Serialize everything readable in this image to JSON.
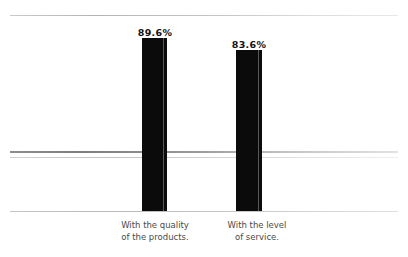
{
  "chart_data": {
    "type": "bar",
    "title": "",
    "subtitle": "",
    "xlabel": "",
    "ylabel": "",
    "grid": false,
    "legend": null,
    "ylim": [
      0,
      100
    ],
    "unit": "%",
    "categories": [
      "With the quality of the products.",
      "With the level of service."
    ],
    "category_lines": [
      [
        "With the quality",
        "of the products."
      ],
      [
        "With the level",
        "of service."
      ]
    ],
    "values": [
      89.6,
      83.6
    ],
    "value_labels": [
      "89.6%",
      "83.6%"
    ],
    "colors": {
      "bar": "#0b0b0b",
      "bar_highlight": "#575757",
      "rule": "#b4b4b4",
      "background": "#ffffff",
      "label_text": "#111111",
      "category_text": "#4a4a4a"
    },
    "rules": [
      {
        "name": "top-rule",
        "y": 15
      },
      {
        "name": "mid-rule-upper",
        "y": 151
      },
      {
        "name": "mid-rule-lower",
        "y": 157
      },
      {
        "name": "baseline-rule",
        "y": 211
      }
    ]
  }
}
